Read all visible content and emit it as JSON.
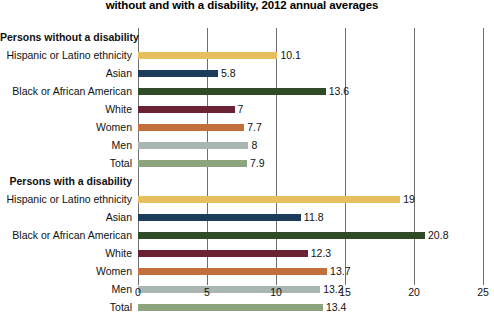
{
  "chart_data": {
    "type": "bar",
    "orientation": "horizontal",
    "title": "without and with a disability, 2012 annual averages",
    "xlabel": "",
    "ylabel": "",
    "xlim": [
      0,
      25
    ],
    "xticks": [
      0,
      5,
      10,
      15,
      20,
      25
    ],
    "xtick_labels": [
      "0",
      "5",
      "10",
      "15",
      "20",
      "25"
    ],
    "grid": true,
    "grid_axis": "x",
    "legend": "none",
    "groups": [
      {
        "label": "Persons without a disability",
        "categories": [
          "Hispanic or Latino ethnicity",
          "Asian",
          "Black or African American",
          "White",
          "Women",
          "Men",
          "Total"
        ],
        "values": [
          10.1,
          5.8,
          13.6,
          7,
          7.7,
          8,
          7.9
        ],
        "value_labels": [
          "10.1",
          "5.8",
          "13.6",
          "7",
          "7.7",
          "8",
          "7.9"
        ],
        "colors": [
          "#e8bf5f",
          "#1d3c5c",
          "#2f4a27",
          "#6b2234",
          "#c1703c",
          "#a9b6b1",
          "#8ca57e"
        ]
      },
      {
        "label": "Persons with a disability",
        "categories": [
          "Hispanic or Latino ethnicity",
          "Asian",
          "Black or African American",
          "White",
          "Women",
          "Men",
          "Total"
        ],
        "values": [
          19,
          11.8,
          20.8,
          12.3,
          13.7,
          13.2,
          13.4
        ],
        "value_labels": [
          "19",
          "11.8",
          "20.8",
          "12.3",
          "13.7",
          "13.2",
          "13.4"
        ],
        "colors": [
          "#e8bf5f",
          "#1d3c5c",
          "#2f4a27",
          "#6b2234",
          "#c1703c",
          "#a9b6b1",
          "#8ca57e"
        ]
      }
    ]
  }
}
